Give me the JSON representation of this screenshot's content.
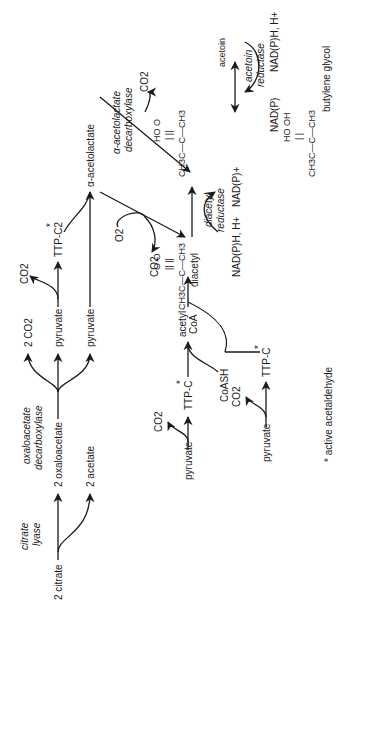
{
  "diagram": {
    "orientation": "rotated-90-ccw",
    "nodes": {
      "citrate": "2 citrate",
      "oxaloacetate": "2 oxaloacetate",
      "acetate": "2 acetate",
      "co2_2": "2 CO2",
      "pyruvate_top": "pyruvate",
      "pyruvate_mid": "pyruvate",
      "co2_pyr": "CO2",
      "ttp_c2": "TTP-C2",
      "acetolactate": "α-acetolactate",
      "o2": "O2",
      "co2_ox": "CO2",
      "co2_dec": "CO2",
      "acetoin": "acetoin",
      "butylene_glycol": "butylene glycol",
      "diacetyl": "diacetyl",
      "pyruvate_b1": "pyruvate",
      "co2_b1": "CO2",
      "ttp_c_b1": "TTP-C",
      "acetyl_coa_1": "acetyl",
      "acetyl_coa_2": "CoA",
      "coash": "CoASH",
      "pyruvate_b2": "pyruvate",
      "co2_b2": "CO2",
      "ttp_c_b2": "TTP-C",
      "nadph_dr": "NAD(P)H, H+",
      "nadp_dr": "NAD(P)+",
      "nadph_ar": "NAD(P)H, H+",
      "nadp_ar": "NAD(P)"
    },
    "enzymes": {
      "citrate_lyase_1": "citrate",
      "citrate_lyase_2": "lyase",
      "oaa_decarb_1": "oxaloacetate",
      "oaa_decarb_2": "decarboxylase",
      "aal_decarb_1": "α-acetolactate",
      "aal_decarb_2": "decarboxylase",
      "diacetyl_red_1": "diacetyl",
      "diacetyl_red_2": "reductase",
      "acetoin_red_1": "acetoin",
      "acetoin_red_2": "reductase"
    },
    "structures": {
      "acetoin_top": "HO    O",
      "acetoin_mid": "|     ||",
      "acetoin_bot": "CH3C—C—CH3",
      "diacetyl_top": "O    O",
      "diacetyl_mid": "||    ||",
      "diacetyl_bot": "CH3C—C—CH3",
      "bg_top": "HO   OH",
      "bg_mid": "|      |",
      "bg_bot": "CH3C—C—CH3"
    },
    "star": "*",
    "footnote": "* active acetaldehyde"
  }
}
